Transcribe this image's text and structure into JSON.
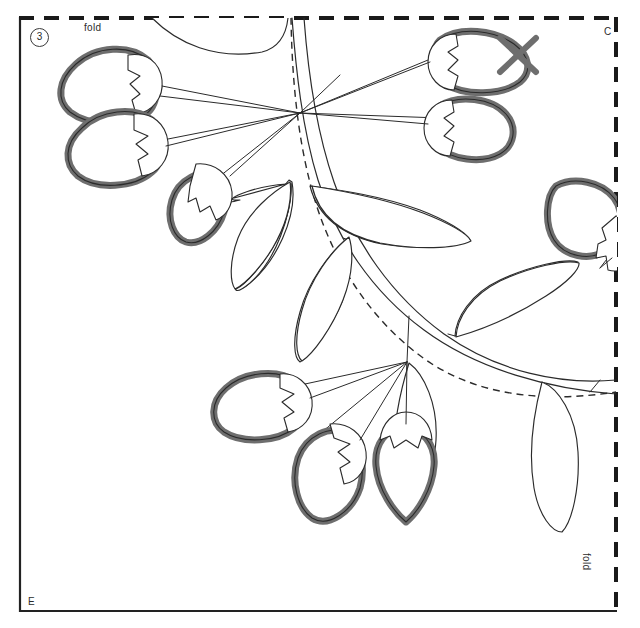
{
  "sheet": {
    "title": "Applique pattern sheet - leaf and berry branch",
    "step_number": "3",
    "labels": {
      "fold_top": "fold",
      "fold_right": "fold",
      "corner_top_right": "C",
      "corner_bottom_left": "E"
    },
    "colors": {
      "background": "#ffffff",
      "outline_thin": "#2b2b2b",
      "berry_outline_thick": "#6e6e6e",
      "border_solid": "#222222",
      "border_dashed": "#1a1a1a",
      "guide_dashed": "#2b2b2b",
      "text": "#2b2b2b"
    },
    "border": {
      "left_style": "solid",
      "bottom_style": "solid",
      "top_style": "dashed",
      "right_style": "dashed",
      "dash_pattern": "14 10",
      "solid_width_px": 2,
      "dashed_width_px": 3,
      "box": {
        "x": 19,
        "y": 17,
        "width": 598,
        "height": 595
      }
    },
    "guide_curve": {
      "style": "dashed",
      "dash_pattern": "7 5",
      "description": "registration overlap curve"
    },
    "motifs": {
      "berries": [
        {
          "id": "berry-top-left-1",
          "cap": "zigzag",
          "tip": "left"
        },
        {
          "id": "berry-top-left-2",
          "cap": "zigzag",
          "tip": "left"
        },
        {
          "id": "berry-top-left-3",
          "cap": "zigzag",
          "tip": "down"
        },
        {
          "id": "berry-top-right-1",
          "cap": "zigzag",
          "tip": "right",
          "mark": "x-cross"
        },
        {
          "id": "berry-top-right-2",
          "cap": "zigzag",
          "tip": "right"
        },
        {
          "id": "berry-mid-right",
          "cap": "zigzag",
          "tip": "left",
          "clipped_by": "right-fold"
        },
        {
          "id": "berry-bottom-1",
          "cap": "zigzag",
          "tip": "left"
        },
        {
          "id": "berry-bottom-2",
          "cap": "zigzag",
          "tip": "down"
        },
        {
          "id": "berry-bottom-3",
          "cap": "zigzag",
          "tip": "down"
        }
      ],
      "leaves_count": 8,
      "branch": {
        "type": "tapered-curve",
        "stems_count": 10
      }
    }
  }
}
